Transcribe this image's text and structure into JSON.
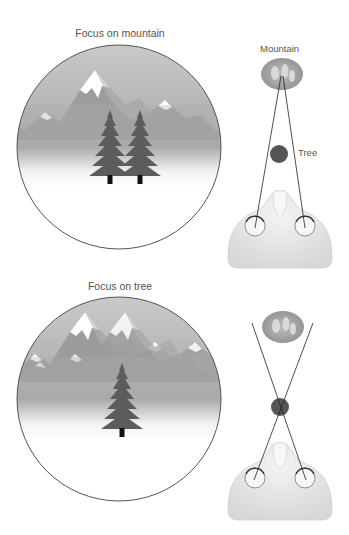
{
  "panels": [
    {
      "title": "Focus on mountain",
      "view": {
        "trees_visible": 2,
        "focus": "mountain",
        "description": "Distant mountain sharp; near tree appears doubled"
      },
      "schematic": {
        "mountain_label": "Mountain",
        "tree_label": "Tree",
        "sight_lines": "converge on mountain"
      }
    },
    {
      "title": "Focus on tree",
      "view": {
        "trees_visible": 1,
        "focus": "tree",
        "description": "Near tree single; lines of sight cross at tree"
      },
      "schematic": {
        "sight_lines": "cross at tree"
      }
    }
  ],
  "colors": {
    "outline": "#555555",
    "sky": "#b8b8b8",
    "tree": "#5a5a5a",
    "trunk": "#111111",
    "head": "#e6e6e6",
    "label_text": "#555555"
  }
}
